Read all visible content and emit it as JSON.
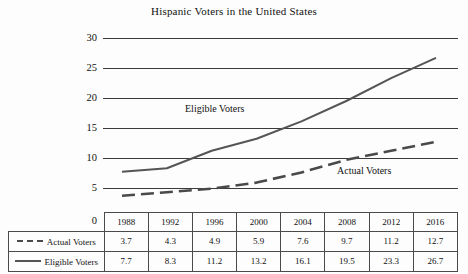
{
  "chart_data": {
    "type": "line",
    "title": "Hispanic Voters in the United States",
    "xlabel": "",
    "ylabel": "",
    "ylim": [
      0,
      30
    ],
    "yticks": [
      0,
      5,
      10,
      15,
      20,
      25,
      30
    ],
    "grid": true,
    "legend_position": "in-table",
    "categories": [
      "1988",
      "1992",
      "1996",
      "2000",
      "2004",
      "2008",
      "2012",
      "2016"
    ],
    "series": [
      {
        "name": "Actual Voters",
        "style": "dashed",
        "color": "#4a4a4a",
        "values": [
          3.7,
          4.3,
          4.9,
          5.9,
          7.6,
          9.7,
          11.2,
          12.7
        ]
      },
      {
        "name": "Eligible Voters",
        "style": "solid",
        "color": "#555555",
        "values": [
          7.7,
          8.3,
          11.2,
          13.2,
          16.1,
          19.5,
          23.3,
          26.7
        ]
      }
    ],
    "annotations": [
      {
        "text": "Eligible Voters",
        "x": 185,
        "y": 103
      },
      {
        "text": "Actual Voters",
        "x": 337,
        "y": 165
      }
    ]
  },
  "table": {
    "header_corner": "",
    "columns": [
      "1988",
      "1992",
      "1996",
      "2000",
      "2004",
      "2008",
      "2012",
      "2016"
    ],
    "rows": [
      {
        "label": "Actual Voters",
        "swatch": "dashed-line-swatch",
        "values": [
          "3.7",
          "4.3",
          "4.9",
          "5.9",
          "7.6",
          "9.7",
          "11.2",
          "12.7"
        ]
      },
      {
        "label": "Eligible Voters",
        "swatch": "solid-line-swatch",
        "values": [
          "7.7",
          "8.3",
          "11.2",
          "13.2",
          "16.1",
          "19.5",
          "23.3",
          "26.7"
        ]
      }
    ]
  },
  "axis": {
    "zero_label": "0",
    "tick_labels": [
      "30",
      "25",
      "20",
      "15",
      "10",
      "5"
    ]
  }
}
